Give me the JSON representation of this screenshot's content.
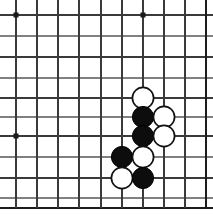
{
  "board": {
    "title": "Go Board Position",
    "game": "go",
    "board_size_shown": {
      "columns": 10,
      "rows": 10
    },
    "geometry": {
      "width": 213,
      "height": 217,
      "col_x": [
        16,
        37,
        58,
        79,
        101,
        122,
        143,
        164,
        185,
        206
      ],
      "row_y": [
        15,
        36,
        57,
        78,
        98,
        117,
        136,
        157,
        178,
        198
      ],
      "bottom_edge_y": 208,
      "right_edge_x": 206,
      "stone_radius": 10.6
    },
    "colors": {
      "background": "#ffffff",
      "grid": "#3a3a3a",
      "grid_faint": "#808080",
      "edge": "#1c1c1c",
      "black_stone": "#0d0d0d",
      "white_stone": "#ffffff",
      "white_stone_outline": "#111111",
      "star_point": "#1a1a1a"
    },
    "star_points": [
      {
        "col": 0,
        "row": 0
      },
      {
        "col": 6,
        "row": 0
      },
      {
        "col": 0,
        "row": 6
      }
    ],
    "stones": [
      {
        "color": "white",
        "col": 6,
        "row": 4
      },
      {
        "color": "black",
        "col": 6,
        "row": 5
      },
      {
        "color": "white",
        "col": 7,
        "row": 5
      },
      {
        "color": "black",
        "col": 6,
        "row": 6
      },
      {
        "color": "white",
        "col": 7,
        "row": 6
      },
      {
        "color": "black",
        "col": 5,
        "row": 7
      },
      {
        "color": "white",
        "col": 6,
        "row": 7
      },
      {
        "color": "white",
        "col": 5,
        "row": 8
      },
      {
        "color": "black",
        "col": 6,
        "row": 8
      }
    ],
    "counts": {
      "black_stones": "4",
      "white_stones": "5",
      "total_stones": "9"
    }
  }
}
